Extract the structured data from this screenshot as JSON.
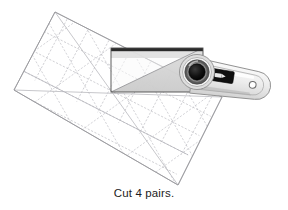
{
  "figure": {
    "caption": "Cut 4 pairs.",
    "alt_description": "quilting ruler laid on a fabric strip with a rotary cutter",
    "background_color": "#ffffff"
  },
  "ruler": {
    "label": "quilting-ruler",
    "fill_color": "#ffffff",
    "edge_color": "#9a9a9a",
    "grid_color": "#b9b9bd",
    "diagonal_color": "#bdbdc2",
    "rotation_deg": 27,
    "corners": [
      {
        "x": 55,
        "y": 12
      },
      {
        "x": 222,
        "y": 97
      },
      {
        "x": 178,
        "y": 185
      },
      {
        "x": 14,
        "y": 90
      }
    ],
    "grid_columns": 7,
    "grid_rows": 4,
    "has_45_degree_diagonals": true,
    "line_style": "dotted"
  },
  "fabric_strip": {
    "label": "fabric-strip",
    "top_edge_color": "#2b2b2b",
    "outline_color": "#4a4a4a",
    "fill_light": "#f2f2f2",
    "fill_shaded": "#d2d2d2",
    "bounds": {
      "x": 111,
      "y": 48,
      "width": 92,
      "height": 44
    },
    "has_diagonal_cut_line": true
  },
  "rotary_cutter": {
    "label": "rotary-cutter",
    "blade_center": {
      "x": 197,
      "y": 72
    },
    "blade_outer_radius": 17,
    "blade_hub_color": "#0d0d0d",
    "blade_ring_color": "#5a5a5a",
    "blade_rim_color": "#d9d9d9",
    "handle_color": "#e9e9e9",
    "handle_edge_color": "#8d8d8d",
    "handle_tip_hole": {
      "x": 265,
      "y": 78,
      "r": 3.4
    },
    "safety_lever_color": "#111111",
    "safety_lever": {
      "x": 212,
      "y": 69,
      "width": 21,
      "height": 10
    }
  }
}
